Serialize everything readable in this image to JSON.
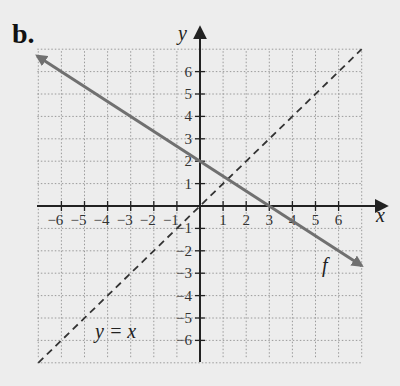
{
  "part_label": "b.",
  "axes": {
    "x_label": "x",
    "y_label": "y",
    "x_ticks": [
      -6,
      -5,
      -4,
      -3,
      -2,
      -1,
      1,
      2,
      3,
      4,
      5,
      6
    ],
    "y_ticks": [
      6,
      5,
      4,
      3,
      2,
      1,
      -1,
      -2,
      -3,
      -4,
      -5,
      -6
    ]
  },
  "labels": {
    "f": "f",
    "identity": "y = x"
  },
  "colors": {
    "background": "#ededed",
    "grid": "#9a9a9a",
    "axis": "#222222",
    "f_line": "#707070",
    "identity_line": "#333333"
  },
  "chart_data": {
    "type": "line",
    "title": "b.",
    "xlabel": "x",
    "ylabel": "y",
    "xlim": [
      -7,
      7
    ],
    "ylim": [
      -7,
      7
    ],
    "grid": true,
    "series": [
      {
        "name": "f",
        "style": "solid with arrows",
        "equation": "y = -2/3 x + 2",
        "x": [
          -7,
          0,
          3,
          7
        ],
        "y": [
          6.67,
          2,
          0,
          -2.67
        ]
      },
      {
        "name": "y = x",
        "style": "dashed",
        "equation": "y = x",
        "x": [
          -7,
          7
        ],
        "y": [
          -7,
          7
        ]
      }
    ],
    "annotations": [
      {
        "text": "f",
        "x": 5.5,
        "y": -2.5
      },
      {
        "text": "y = x",
        "x": -3.5,
        "y": -5.5
      }
    ]
  }
}
